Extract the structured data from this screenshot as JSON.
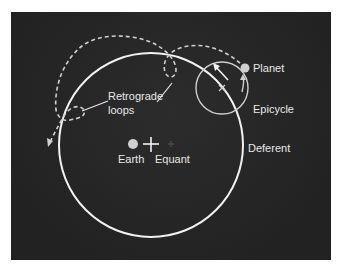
{
  "diagram": {
    "colors": {
      "background": "#262626",
      "page": "#ffffff",
      "lines": "#f2f2f2",
      "dashed_path": "#d0d0d0",
      "epicycle": "#cfcfcf",
      "earth": "#cfcfcf",
      "planet": "#cfcfcf",
      "equant": "#4a4a4a"
    },
    "labels": {
      "planet": "Planet",
      "epicycle": "Epicycle",
      "deferent": "Deferent",
      "earth": "Earth",
      "equant": "Equant",
      "retrograde_line1": "Retrograde",
      "retrograde_line2": "loops"
    },
    "icons": {
      "earth": "filled-circle",
      "center": "plus-cross",
      "equant": "small-plus",
      "planet": "filled-circle",
      "epicycle_center": "x-mark",
      "motion_arrows": "arrow"
    }
  }
}
